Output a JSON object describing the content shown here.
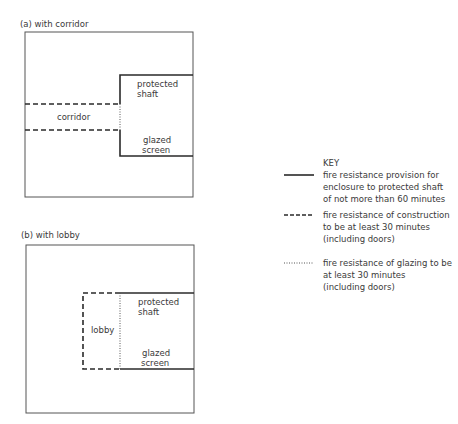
{
  "diagram_a": {
    "title": "(a) with corridor",
    "labels": {
      "shaft_line1": "protected",
      "shaft_line2": "shaft",
      "corridor": "corridor",
      "screen_line1": "glazed",
      "screen_line2": "screen"
    }
  },
  "diagram_b": {
    "title": "(b) with lobby",
    "labels": {
      "shaft_line1": "protected",
      "shaft_line2": "shaft",
      "lobby": "lobby",
      "screen_line1": "glazed",
      "screen_line2": "screen"
    }
  },
  "key": {
    "heading": "KEY",
    "items": [
      {
        "style": "solid",
        "lines": [
          "fire resistance provision for",
          "enclosure to protected shaft",
          "of not more than 60 minutes"
        ]
      },
      {
        "style": "dashed",
        "lines": [
          "fire resistance of construction",
          "to be at least 30 minutes",
          "(including doors)"
        ]
      },
      {
        "style": "dotted",
        "lines": [
          "fire resistance of glazing to be",
          "at least 30 minutes",
          "(including doors)"
        ]
      }
    ]
  },
  "colors": {
    "line": "#2a2a2a",
    "outline": "#555555",
    "text": "#3a3a3a"
  }
}
